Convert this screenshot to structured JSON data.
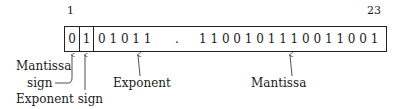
{
  "diagram": {
    "title": "",
    "index_labels": {
      "start": "1",
      "end": "23"
    },
    "cells": {
      "mantissa_sign_bit": "0",
      "exponent_sign_bit": "1",
      "exponent_bits": "0 1 0 1 1",
      "separator": ".",
      "mantissa_bits": "1 1 0 0 1 0 1 1 1 0 0 1 1 0 0 1"
    },
    "labels": {
      "mantissa_sign_line1": "Mantissa",
      "mantissa_sign_line2": "sign",
      "exponent_sign": "Exponent sign",
      "exponent": "Exponent",
      "mantissa": "Mantissa"
    }
  }
}
